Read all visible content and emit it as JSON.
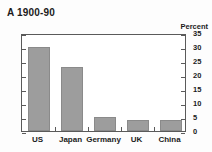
{
  "chart_data": {
    "type": "bar",
    "title": "A 1900-90",
    "xlabel": "",
    "ylabel": "Percent",
    "categories": [
      "US",
      "Japan",
      "Germany",
      "UK",
      "China"
    ],
    "values": [
      30,
      23,
      5,
      4,
      4
    ],
    "ylim": [
      0,
      35
    ],
    "yticks": [
      0,
      5,
      10,
      15,
      20,
      25,
      30,
      35
    ],
    "ytick_labels": [
      "0",
      "5",
      "10",
      "15",
      "20",
      "25",
      "30",
      "35"
    ],
    "axis_side": "right",
    "grid": false,
    "legend": null,
    "bar_color": "#9d9d9d",
    "axis_color": "#5a5a5a",
    "text_color": "#1b1b1b",
    "background": "#ffffff"
  },
  "title": {
    "text": "A 1900-90"
  },
  "axis": {
    "unit_label": "Percent",
    "labels": [
      "35",
      "30",
      "25",
      "20",
      "15",
      "10",
      "5",
      "0"
    ]
  },
  "categories": [
    {
      "label": "US"
    },
    {
      "label": "Japan"
    },
    {
      "label": "Germany"
    },
    {
      "label": "UK"
    },
    {
      "label": "China"
    }
  ]
}
